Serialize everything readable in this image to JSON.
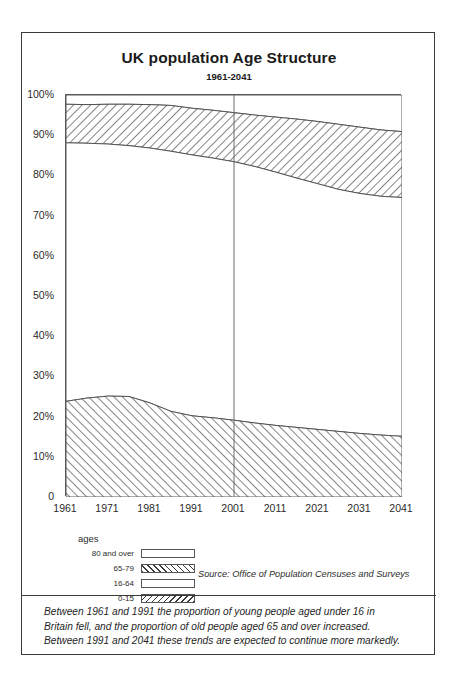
{
  "figure": {
    "title": "UK population Age Structure",
    "subtitle": "1961-2041",
    "source": "Source: Office of Population Censuses and Surveys",
    "legend_title": "ages",
    "caption_lines": [
      "Between 1961 and 1991 the proportion of young people aged under 16 in",
      "Britain fell, and the proportion of old people aged 65 and over increased.",
      "Between 1991 and 2041 these trends are expected to continue more markedly."
    ]
  },
  "legend": {
    "items": [
      {
        "label": "80 and over",
        "pattern": "solid-white"
      },
      {
        "label": "65-79",
        "pattern": "forward-hatch"
      },
      {
        "label": "16-64",
        "pattern": "solid-white"
      },
      {
        "label": "0-15",
        "pattern": "backward-hatch"
      }
    ]
  },
  "chart_data": {
    "type": "area",
    "title": "UK population Age Structure",
    "subtitle": "1961-2041",
    "xlabel": "",
    "ylabel": "",
    "xlim": [
      1961,
      2041
    ],
    "ylim": [
      0,
      100
    ],
    "grid": false,
    "legend_position": "below-left",
    "stacked": true,
    "x": [
      1961,
      1966,
      1971,
      1976,
      1981,
      1986,
      1991,
      1996,
      2001,
      2006,
      2011,
      2016,
      2021,
      2026,
      2031,
      2036,
      2041
    ],
    "xticks": [
      "1961",
      "1971",
      "1981",
      "1991",
      "2001",
      "2011",
      "2021",
      "2031",
      "2041"
    ],
    "ytick_labels": [
      "0",
      "10%",
      "20%",
      "30%",
      "40%",
      "50%",
      "60%",
      "70%",
      "80%",
      "90%",
      "100%"
    ],
    "ytick_values": [
      0,
      10,
      20,
      30,
      40,
      50,
      60,
      70,
      80,
      90,
      100
    ],
    "series": [
      {
        "name": "0-15",
        "values": [
          23.8,
          24.6,
          25.1,
          25.0,
          23.4,
          21.3,
          20.2,
          19.7,
          19.1,
          18.4,
          17.8,
          17.3,
          16.8,
          16.3,
          15.8,
          15.4,
          15.1
        ]
      },
      {
        "name": "16-64",
        "values": [
          64.3,
          63.4,
          62.7,
          62.4,
          63.4,
          64.7,
          64.9,
          64.6,
          64.3,
          63.8,
          63.0,
          62.0,
          61.1,
          60.2,
          59.7,
          59.4,
          59.4
        ]
      },
      {
        "name": "65-79",
        "values": [
          9.6,
          9.6,
          9.9,
          10.3,
          10.8,
          11.4,
          11.6,
          11.9,
          12.2,
          12.8,
          13.7,
          14.7,
          15.5,
          16.2,
          16.5,
          16.5,
          16.4
        ]
      },
      {
        "name": "80 and over",
        "values": [
          2.3,
          2.4,
          2.3,
          2.3,
          2.4,
          2.6,
          3.3,
          3.8,
          4.4,
          5.0,
          5.5,
          6.0,
          6.6,
          7.3,
          8.0,
          8.7,
          9.1
        ]
      }
    ],
    "cumulative_boundaries": {
      "top_of_0_15": [
        23.8,
        24.6,
        25.1,
        25.0,
        23.4,
        21.3,
        20.2,
        19.7,
        19.1,
        18.4,
        17.8,
        17.3,
        16.8,
        16.3,
        15.8,
        15.4,
        15.1
      ],
      "top_of_16_64": [
        88.1,
        88.0,
        87.8,
        87.4,
        86.8,
        86.0,
        85.1,
        84.3,
        83.4,
        82.2,
        80.8,
        79.3,
        77.9,
        76.5,
        75.5,
        74.8,
        74.5
      ],
      "top_of_65_79": [
        97.7,
        97.6,
        97.7,
        97.7,
        97.6,
        97.4,
        96.7,
        96.2,
        95.6,
        95.0,
        94.5,
        94.0,
        93.4,
        92.7,
        92.0,
        91.3,
        90.9
      ],
      "top_of_80_plus": [
        100,
        100,
        100,
        100,
        100,
        100,
        100,
        100,
        100,
        100,
        100,
        100,
        100,
        100,
        100,
        100,
        100
      ]
    },
    "annotations": [
      {
        "type": "vertical-line",
        "x": 2001,
        "note": "divides observed from projected"
      }
    ],
    "source": "Source: Office of Population Censuses and Surveys"
  }
}
